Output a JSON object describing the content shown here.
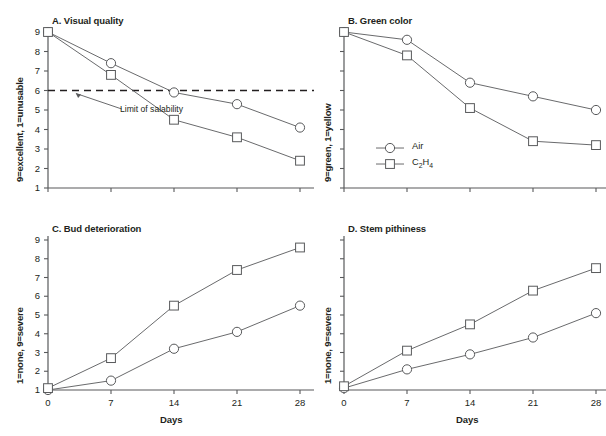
{
  "figure": {
    "legend": [
      {
        "name": "series-air",
        "label": "Air",
        "marker": "circle-marker"
      },
      {
        "name": "series-c2h4",
        "label": "C2H4",
        "label_html": "C₂H₄",
        "marker": "square-marker"
      }
    ],
    "xlabel": "Days",
    "xticks": [
      "0",
      "7",
      "14",
      "21",
      "28"
    ],
    "yticks": [
      "1",
      "2",
      "3",
      "4",
      "5",
      "6",
      "7",
      "8",
      "9"
    ],
    "annotation": "Limit of salability",
    "colors": {
      "line": "#58595b",
      "marker": "#58595b",
      "axis": "#58595b",
      "text": "#231f20"
    }
  },
  "chart_data": [
    {
      "type": "line",
      "panel": "A",
      "title": "A. Visual quality",
      "xlabel": "Days",
      "ylabel": "9=excellent, 1=unusable",
      "x": [
        0,
        7,
        14,
        21,
        28
      ],
      "xlim": [
        0,
        28
      ],
      "ylim": [
        1,
        9
      ],
      "yticks_labeled": true,
      "grid": false,
      "legend_position": "none",
      "annotations": [
        {
          "text": "Limit of salability",
          "type": "threshold-line",
          "y": 6,
          "style": "dashed"
        }
      ],
      "series": [
        {
          "name": "Air",
          "marker": "circle",
          "values": [
            9.0,
            7.4,
            5.9,
            5.3,
            4.1
          ]
        },
        {
          "name": "C2H4",
          "marker": "square",
          "values": [
            9.0,
            6.8,
            4.5,
            3.6,
            2.4
          ]
        }
      ]
    },
    {
      "type": "line",
      "panel": "B",
      "title": "B. Green color",
      "xlabel": "Days",
      "ylabel": "9=green, 1=yellow",
      "x": [
        0,
        7,
        14,
        21,
        28
      ],
      "xlim": [
        0,
        28
      ],
      "ylim": [
        1,
        9
      ],
      "yticks_labeled": false,
      "grid": false,
      "legend_position": "lower-left",
      "series": [
        {
          "name": "Air",
          "marker": "circle",
          "values": [
            9.0,
            8.6,
            6.4,
            5.7,
            5.0
          ]
        },
        {
          "name": "C2H4",
          "marker": "square",
          "values": [
            9.0,
            7.8,
            5.1,
            3.4,
            3.2
          ]
        }
      ]
    },
    {
      "type": "line",
      "panel": "C",
      "title": "C. Bud deterioration",
      "xlabel": "Days",
      "ylabel": "1=none, 9=severe",
      "x": [
        0,
        7,
        14,
        21,
        28
      ],
      "xlim": [
        0,
        28
      ],
      "ylim": [
        1,
        9
      ],
      "yticks_labeled": true,
      "grid": false,
      "legend_position": "none",
      "series": [
        {
          "name": "Air",
          "marker": "circle",
          "values": [
            1.0,
            1.5,
            3.2,
            4.1,
            5.5
          ]
        },
        {
          "name": "C2H4",
          "marker": "square",
          "values": [
            1.1,
            2.7,
            5.5,
            7.4,
            8.6
          ]
        }
      ]
    },
    {
      "type": "line",
      "panel": "D",
      "title": "D. Stem pithiness",
      "xlabel": "Days",
      "ylabel": "1=none, 9=severe",
      "x": [
        0,
        7,
        14,
        21,
        28
      ],
      "xlim": [
        0,
        28
      ],
      "ylim": [
        1,
        9
      ],
      "yticks_labeled": false,
      "grid": false,
      "legend_position": "none",
      "series": [
        {
          "name": "Air",
          "marker": "circle",
          "values": [
            1.1,
            2.1,
            2.9,
            3.8,
            5.1
          ]
        },
        {
          "name": "C2H4",
          "marker": "square",
          "values": [
            1.2,
            3.1,
            4.5,
            6.3,
            7.5
          ]
        }
      ]
    }
  ]
}
